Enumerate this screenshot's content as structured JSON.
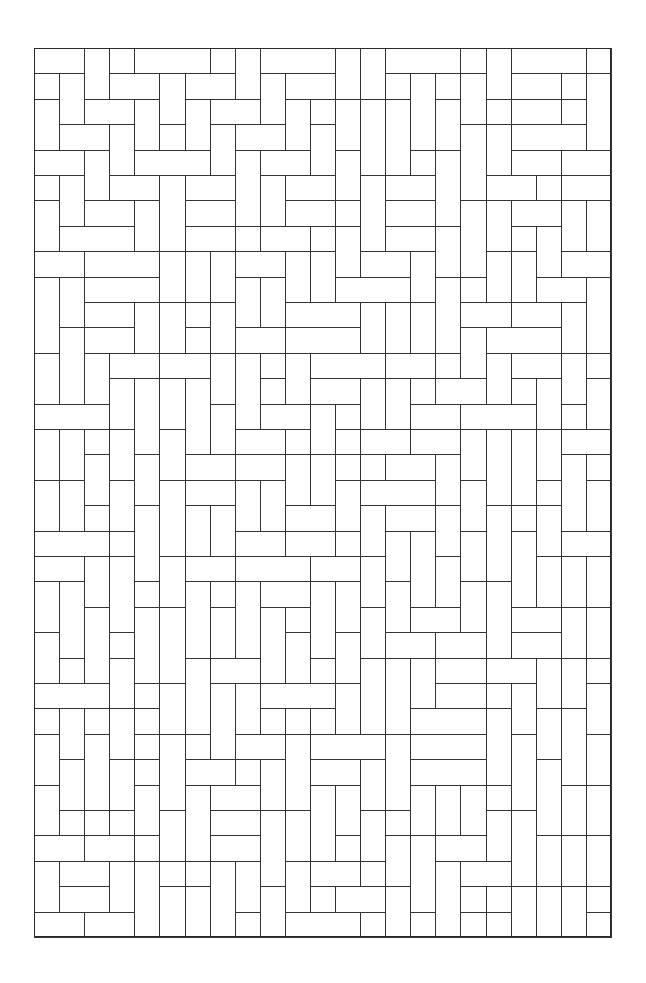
{
  "puzzle": {
    "type": "rectangle-tiling-line-drawing",
    "line_color": "#333333",
    "background": "#ffffff",
    "frame": {
      "left": 34,
      "top": 48,
      "right": 611,
      "bottom": 937
    },
    "grid": {
      "cols": 23,
      "rows": 35,
      "cell_w": 25.09,
      "cell_h": 25.4
    },
    "tile_shapes": [
      "1x1",
      "1x2",
      "2x1",
      "1x3",
      "3x1",
      "1x4",
      "4x1"
    ],
    "tiles": [
      {
        "c": 0,
        "r": 0,
        "w": 2,
        "h": 1
      },
      {
        "c": 2,
        "r": 0,
        "w": 1,
        "h": 2
      },
      {
        "c": 3,
        "r": 0,
        "w": 1,
        "h": 1
      },
      {
        "c": 4,
        "r": 0,
        "w": 3,
        "h": 1
      },
      {
        "c": 7,
        "r": 0,
        "w": 1,
        "h": 1
      },
      {
        "c": 8,
        "r": 0,
        "w": 1,
        "h": 2
      },
      {
        "c": 9,
        "r": 0,
        "w": 3,
        "h": 1
      },
      {
        "c": 0,
        "r": 1,
        "w": 1,
        "h": 1
      },
      {
        "c": 1,
        "r": 1,
        "w": 1,
        "h": 2
      },
      {
        "c": 3,
        "r": 1,
        "w": 2,
        "h": 1
      },
      {
        "c": 5,
        "r": 1,
        "w": 1,
        "h": 2
      },
      {
        "c": 6,
        "r": 1,
        "w": 2,
        "h": 1
      },
      {
        "c": 9,
        "r": 1,
        "w": 1,
        "h": 2
      },
      {
        "c": 10,
        "r": 1,
        "w": 2,
        "h": 1
      },
      {
        "c": 0,
        "r": 2,
        "w": 1,
        "h": 2
      },
      {
        "c": 2,
        "r": 2,
        "w": 2,
        "h": 1
      },
      {
        "c": 4,
        "r": 2,
        "w": 1,
        "h": 2
      },
      {
        "c": 6,
        "r": 2,
        "w": 1,
        "h": 2
      },
      {
        "c": 7,
        "r": 2,
        "w": 2,
        "h": 1
      },
      {
        "c": 10,
        "r": 2,
        "w": 1,
        "h": 2
      },
      {
        "c": 11,
        "r": 2,
        "w": 1,
        "h": 1
      },
      {
        "c": 1,
        "r": 3,
        "w": 2,
        "h": 1
      },
      {
        "c": 3,
        "r": 3,
        "w": 1,
        "h": 2
      },
      {
        "c": 5,
        "r": 3,
        "w": 1,
        "h": 1
      },
      {
        "c": 7,
        "r": 3,
        "w": 1,
        "h": 2
      },
      {
        "c": 8,
        "r": 3,
        "w": 2,
        "h": 1
      },
      {
        "c": 11,
        "r": 3,
        "w": 1,
        "h": 2
      },
      {
        "c": 0,
        "r": 4,
        "w": 2,
        "h": 1
      },
      {
        "c": 2,
        "r": 4,
        "w": 1,
        "h": 2
      },
      {
        "c": 4,
        "r": 4,
        "w": 3,
        "h": 1
      },
      {
        "c": 8,
        "r": 4,
        "w": 1,
        "h": 3
      },
      {
        "c": 9,
        "r": 4,
        "w": 2,
        "h": 1
      },
      {
        "c": 0,
        "r": 5,
        "w": 1,
        "h": 1
      },
      {
        "c": 1,
        "r": 5,
        "w": 1,
        "h": 2
      },
      {
        "c": 3,
        "r": 5,
        "w": 2,
        "h": 1
      },
      {
        "c": 5,
        "r": 5,
        "w": 1,
        "h": 3
      },
      {
        "c": 6,
        "r": 5,
        "w": 2,
        "h": 1
      },
      {
        "c": 9,
        "r": 5,
        "w": 1,
        "h": 2
      },
      {
        "c": 10,
        "r": 5,
        "w": 2,
        "h": 1
      },
      {
        "c": 0,
        "r": 6,
        "w": 1,
        "h": 2
      },
      {
        "c": 2,
        "r": 6,
        "w": 2,
        "h": 1
      },
      {
        "c": 4,
        "r": 6,
        "w": 1,
        "h": 2
      },
      {
        "c": 6,
        "r": 6,
        "w": 2,
        "h": 1
      },
      {
        "c": 10,
        "r": 6,
        "w": 2,
        "h": 1
      },
      {
        "c": 1,
        "r": 7,
        "w": 3,
        "h": 1
      },
      {
        "c": 6,
        "r": 7,
        "w": 2,
        "h": 1
      },
      {
        "c": 8,
        "r": 7,
        "w": 1,
        "h": 1
      },
      {
        "c": 9,
        "r": 7,
        "w": 2,
        "h": 1
      },
      {
        "c": 11,
        "r": 7,
        "w": 1,
        "h": 1
      }
    ]
  }
}
